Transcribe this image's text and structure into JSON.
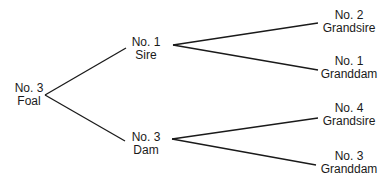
{
  "diagram": {
    "type": "pedigree-tree",
    "nodes": {
      "foal": {
        "number": "No. 3",
        "role": "Foal"
      },
      "sire": {
        "number": "No. 1",
        "role": "Sire"
      },
      "dam": {
        "number": "No. 3",
        "role": "Dam"
      },
      "sire_grandsire": {
        "number": "No. 2",
        "role": "Grandsire"
      },
      "sire_granddam": {
        "number": "No. 1",
        "role": "Granddam"
      },
      "dam_grandsire": {
        "number": "No. 4",
        "role": "Grandsire"
      },
      "dam_granddam": {
        "number": "No. 3",
        "role": "Granddam"
      }
    },
    "edges": [
      [
        "foal",
        "sire"
      ],
      [
        "foal",
        "dam"
      ],
      [
        "sire",
        "sire_grandsire"
      ],
      [
        "sire",
        "sire_granddam"
      ],
      [
        "dam",
        "dam_grandsire"
      ],
      [
        "dam",
        "dam_granddam"
      ]
    ],
    "line_color": "#1a1a1a"
  }
}
